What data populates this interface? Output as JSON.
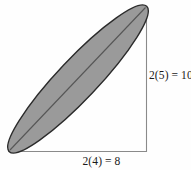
{
  "figure": {
    "type": "geometry-diagram",
    "colors": {
      "background": "#fefefe",
      "ellipse_fill": "#9a9a9a",
      "ellipse_stroke": "#2b2b2b",
      "axis_line": "#8a8a8a",
      "diagonal_line": "#555555",
      "text": "#1a1a1a"
    },
    "labels": {
      "vertical_side": "2(5) = 10",
      "horizontal_side": "2(4) = 8"
    },
    "geometry": {
      "rectangle": {
        "left": 9,
        "top": 6,
        "right": 147,
        "bottom": 152,
        "width": 138,
        "height": 146,
        "drawn_edges": [
          "right",
          "bottom"
        ]
      },
      "ellipse": {
        "center_x": 78,
        "center_y": 79,
        "semi_major": 100,
        "semi_minor": 20,
        "rotation_deg": -46.6
      },
      "diagonal": {
        "x1": 9,
        "y1": 151,
        "x2": 146,
        "y2": 7
      }
    }
  }
}
